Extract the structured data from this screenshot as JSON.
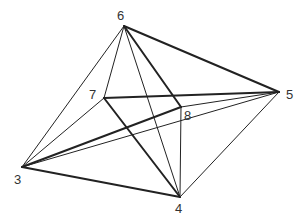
{
  "figure": {
    "type": "wireframe-polyhedron",
    "line_color": "#222222",
    "background": "#ffffff",
    "vertices": [
      {
        "id": "3",
        "label": "3",
        "x": 22,
        "y": 167,
        "lx": 14,
        "ly": 184
      },
      {
        "id": "4",
        "label": "4",
        "x": 180,
        "y": 197,
        "lx": 175,
        "ly": 213
      },
      {
        "id": "5",
        "label": "5",
        "x": 279,
        "y": 92,
        "lx": 286,
        "ly": 99
      },
      {
        "id": "6",
        "label": "6",
        "x": 124,
        "y": 26,
        "lx": 117,
        "ly": 20
      },
      {
        "id": "7",
        "label": "7",
        "x": 104,
        "y": 98,
        "lx": 89,
        "ly": 99
      },
      {
        "id": "8",
        "label": "8",
        "x": 181,
        "y": 107,
        "lx": 184,
        "ly": 120
      }
    ],
    "edges": [
      {
        "from": "6",
        "to": "5",
        "weight": "thick"
      },
      {
        "from": "6",
        "to": "3",
        "weight": "thin"
      },
      {
        "from": "6",
        "to": "7",
        "weight": "thin"
      },
      {
        "from": "6",
        "to": "8",
        "weight": "thick"
      },
      {
        "from": "6",
        "to": "4",
        "weight": "thin"
      },
      {
        "from": "7",
        "to": "5",
        "weight": "thick"
      },
      {
        "from": "7",
        "to": "4",
        "weight": "thick"
      },
      {
        "from": "7",
        "to": "3",
        "weight": "thin"
      },
      {
        "from": "8",
        "to": "3",
        "weight": "thick"
      },
      {
        "from": "8",
        "to": "4",
        "weight": "thin"
      },
      {
        "from": "8",
        "to": "5",
        "weight": "thin"
      },
      {
        "from": "3",
        "to": "5",
        "weight": "thin"
      },
      {
        "from": "3",
        "to": "4",
        "weight": "thick"
      },
      {
        "from": "4",
        "to": "5",
        "weight": "thin"
      }
    ]
  }
}
